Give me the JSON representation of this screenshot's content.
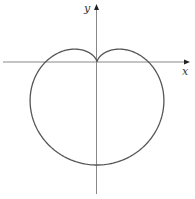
{
  "chart_data": {
    "type": "line",
    "title": "",
    "xlabel": "x",
    "ylabel": "y",
    "grid": false,
    "legend": null,
    "equation": "r = 1 - sin(theta)",
    "series": [
      {
        "name": "cardioid",
        "color": "#555555",
        "parametric": "x = (1 - sin t) cos t, y = (1 - sin t) sin t, t in [0, 2π]",
        "key_points": [
          {
            "label": "cusp",
            "x": 0,
            "y": 0
          },
          {
            "label": "bottom",
            "x": 0,
            "y": -2
          },
          {
            "label": "x-intercept-right",
            "x": 1,
            "y": 0
          },
          {
            "label": "x-intercept-left",
            "x": -1,
            "y": 0
          },
          {
            "label": "top-bump-right",
            "x": 0.433,
            "y": 0.25
          },
          {
            "label": "top-bump-left",
            "x": -0.433,
            "y": 0.25
          },
          {
            "label": "rightmost",
            "x": 1.299,
            "y": -0.75
          },
          {
            "label": "leftmost",
            "x": -1.299,
            "y": -0.75
          }
        ]
      }
    ]
  },
  "axes": {
    "x_label": "x",
    "y_label": "y",
    "color": "#888888"
  },
  "curve": {
    "scale": 51.5,
    "origin_px": [
      97,
      62
    ],
    "stroke": "#555555"
  }
}
